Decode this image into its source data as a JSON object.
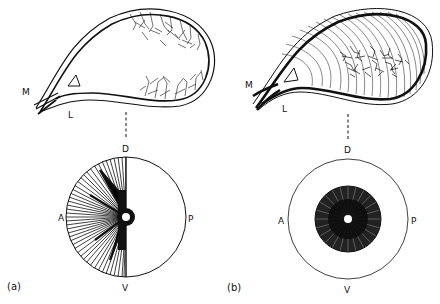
{
  "figure": {
    "panels": [
      {
        "id": "a",
        "label": "(a)",
        "shape_labels": {
          "medial": "M",
          "lateral": "L"
        },
        "compass": {
          "dorsal": "D",
          "ventral": "V",
          "anterior": "A",
          "posterior": "P"
        },
        "fiber_pattern": "fibers fan into anterior half; arborizations along dorsal and ventral margins"
      },
      {
        "id": "b",
        "label": "(b)",
        "shape_labels": {
          "medial": "M",
          "lateral": "L"
        },
        "compass": {
          "dorsal": "D",
          "ventral": "V",
          "anterior": "A",
          "posterior": "P"
        },
        "fiber_pattern": "fibers arc over whole structure; arborizations in central region"
      }
    ],
    "colors": {
      "ink": "#111111",
      "background": "#ffffff"
    }
  }
}
